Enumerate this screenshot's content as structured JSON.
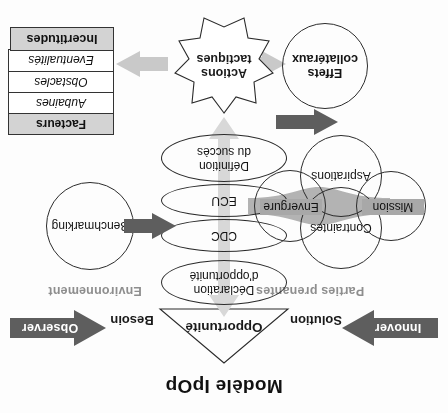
{
  "title": "Modèle IpOp",
  "triangle": {
    "apex_label": "Opportunité",
    "left_label": "Solution",
    "right_label": "Besoin"
  },
  "arrows": {
    "innover": "Innover",
    "observer": "Observer"
  },
  "captions": {
    "parties_prenantes": "Parties prenantes",
    "environnement": "Environnement"
  },
  "ellipses": [
    {
      "id": "declaration",
      "label": "Déclaration\nd'opportunité"
    },
    {
      "id": "cdc",
      "label": "CDC"
    },
    {
      "id": "ecu",
      "label": "ECU"
    },
    {
      "id": "definition",
      "label": "Définition\ndu succès"
    }
  ],
  "stakeholder_circles": {
    "mission": "Mission",
    "aspirations": "Aspirations",
    "contraintes": "Contraintes",
    "envergure": "Envergure"
  },
  "benchmarking": "Benchmarking",
  "star": {
    "label": "Actions\ntactiques"
  },
  "effets": "Effets\ncollatéraux",
  "environment_table": {
    "header": "Facteurs",
    "rows": [
      "Aubaines",
      "Obstacles",
      "Eventualités"
    ]
  },
  "incertitudes": "Incertitudes",
  "colors": {
    "dark_arrow": "#5e5e5e",
    "light_arrow": "#c9c9c9",
    "mid_arrow": "#b3b3b3",
    "table_header_fill": "#d3d3d3",
    "caption_text": "#8e8e8e",
    "stroke": "#2b2b2b"
  }
}
